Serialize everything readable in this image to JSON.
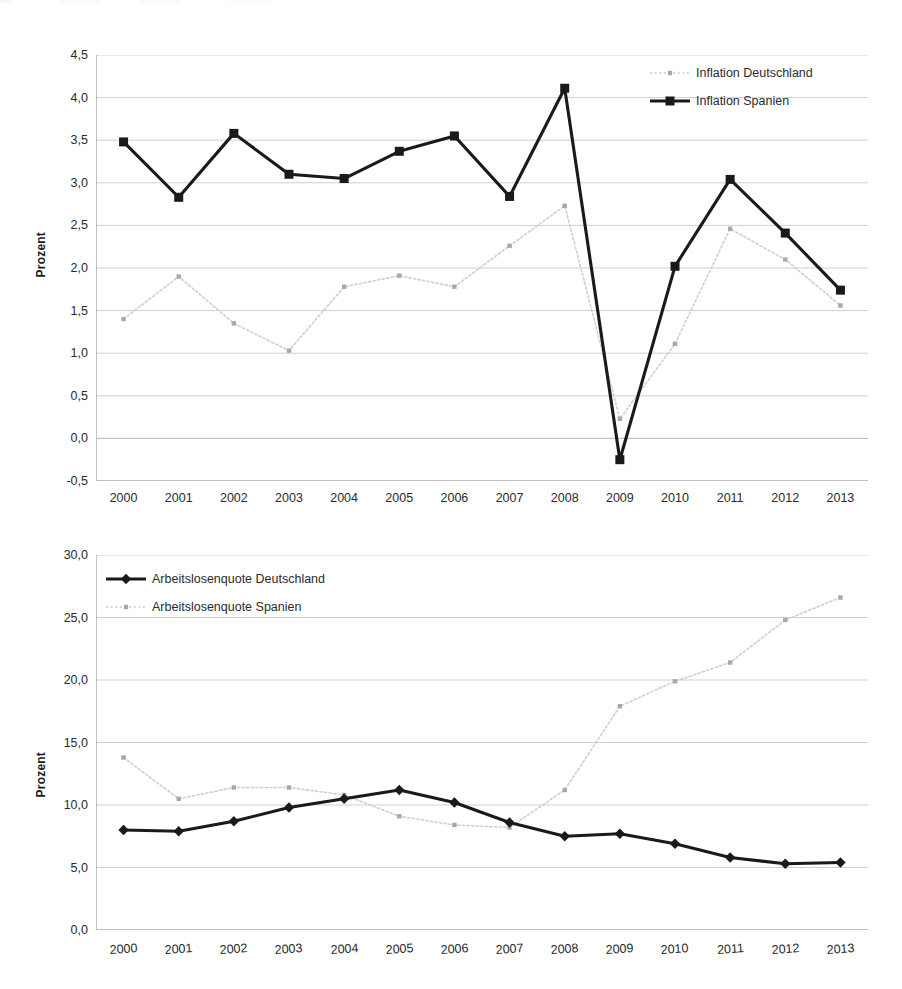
{
  "charts": [
    {
      "id": "inflation",
      "ylabel": "Prozent",
      "ylabel_name": "y-axis-title-inflation",
      "yticks": [
        "4,5",
        "4,0",
        "3,5",
        "3,0",
        "2,5",
        "2,0",
        "1,5",
        "1,0",
        "0,5",
        "0,0",
        "-0,5"
      ],
      "xticks": [
        "2000",
        "2001",
        "2002",
        "2003",
        "2004",
        "2005",
        "2006",
        "2007",
        "2008",
        "2009",
        "2010",
        "2011",
        "2012",
        "2013"
      ],
      "legend": [
        {
          "label": "Inflation Deutschland",
          "style": "dotted-light",
          "color": "#c9c9c9",
          "marker": "small-dot"
        },
        {
          "label": "Inflation Spanien",
          "style": "solid-bold",
          "color": "#1a1a1a",
          "marker": "square"
        }
      ]
    },
    {
      "id": "arbeitslosenquote",
      "ylabel": "Prozent",
      "ylabel_name": "y-axis-title-arbeitslosenquote",
      "yticks": [
        "30,0",
        "25,0",
        "20,0",
        "15,0",
        "10,0",
        "5,0",
        "0,0"
      ],
      "xticks": [
        "2000",
        "2001",
        "2002",
        "2003",
        "2004",
        "2005",
        "2006",
        "2007",
        "2008",
        "2009",
        "2010",
        "2011",
        "2012",
        "2013"
      ],
      "legend": [
        {
          "label": "Arbeitslosenquote Deutschland",
          "style": "solid-bold",
          "color": "#1a1a1a",
          "marker": "diamond"
        },
        {
          "label": "Arbeitslosenquote Spanien",
          "style": "dotted-light",
          "color": "#c9c9c9",
          "marker": "small-dot"
        }
      ]
    }
  ],
  "chart_data": [
    {
      "type": "line",
      "title": "",
      "xlabel": "",
      "ylabel": "Prozent",
      "x": [
        2000,
        2001,
        2002,
        2003,
        2004,
        2005,
        2006,
        2007,
        2008,
        2009,
        2010,
        2011,
        2012,
        2013
      ],
      "categories": [
        "2000",
        "2001",
        "2002",
        "2003",
        "2004",
        "2005",
        "2006",
        "2007",
        "2008",
        "2009",
        "2010",
        "2011",
        "2012",
        "2013"
      ],
      "ylim": [
        -0.5,
        4.5
      ],
      "ytick_values": [
        4.5,
        4.0,
        3.5,
        3.0,
        2.5,
        2.0,
        1.5,
        1.0,
        0.5,
        0.0,
        -0.5
      ],
      "grid": true,
      "legend_position": "top-right",
      "series": [
        {
          "name": "Inflation Deutschland",
          "color": "#c9c9c9",
          "style": "dotted",
          "marker": "small-dot",
          "values": [
            1.4,
            1.9,
            1.35,
            1.03,
            1.78,
            1.91,
            1.78,
            2.26,
            2.73,
            0.23,
            1.11,
            2.46,
            2.1,
            1.56
          ]
        },
        {
          "name": "Inflation Spanien",
          "color": "#1a1a1a",
          "style": "solid",
          "marker": "square",
          "values": [
            3.48,
            2.83,
            3.58,
            3.1,
            3.05,
            3.37,
            3.55,
            2.84,
            4.11,
            -0.25,
            2.02,
            3.04,
            2.41,
            1.74
          ]
        }
      ]
    },
    {
      "type": "line",
      "title": "",
      "xlabel": "",
      "ylabel": "Prozent",
      "x": [
        2000,
        2001,
        2002,
        2003,
        2004,
        2005,
        2006,
        2007,
        2008,
        2009,
        2010,
        2011,
        2012,
        2013
      ],
      "categories": [
        "2000",
        "2001",
        "2002",
        "2003",
        "2004",
        "2005",
        "2006",
        "2007",
        "2008",
        "2009",
        "2010",
        "2011",
        "2012",
        "2013"
      ],
      "ylim": [
        0.0,
        30.0
      ],
      "ytick_values": [
        30.0,
        25.0,
        20.0,
        15.0,
        10.0,
        5.0,
        0.0
      ],
      "grid": true,
      "legend_position": "top-left",
      "series": [
        {
          "name": "Arbeitslosenquote Deutschland",
          "color": "#1a1a1a",
          "style": "solid",
          "marker": "diamond",
          "values": [
            8.0,
            7.9,
            8.7,
            9.8,
            10.5,
            11.2,
            10.2,
            8.6,
            7.5,
            7.7,
            6.9,
            5.8,
            5.3,
            5.4
          ]
        },
        {
          "name": "Arbeitslosenquote Spanien",
          "color": "#c9c9c9",
          "style": "dotted",
          "marker": "small-dot",
          "values": [
            13.8,
            10.5,
            11.4,
            11.4,
            10.8,
            9.1,
            8.4,
            8.2,
            11.2,
            17.9,
            19.9,
            21.4,
            24.8,
            26.6
          ]
        }
      ]
    }
  ]
}
